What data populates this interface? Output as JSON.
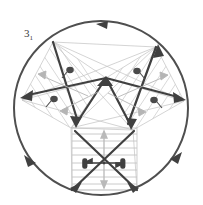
{
  "figure": {
    "title_label": "3",
    "title_subscript": "1",
    "type": "crystallographic-symmetry-diagram"
  },
  "colors": {
    "dark_stroke": "#4a4a4a",
    "mid_stroke": "#6e6e6e",
    "light_stroke": "#b8b8b8",
    "very_light_stroke": "#cccccc",
    "background": "#ffffff",
    "arrow_fill": "#4a4a4a"
  },
  "geometry": {
    "circle": {
      "cx": 101,
      "cy": 108,
      "r": 87
    },
    "circle_arrowheads": [
      {
        "name": "top-arrowhead",
        "angle_deg": 100
      },
      {
        "name": "lower-left-arrowhead",
        "angle_deg": 220
      },
      {
        "name": "lower-right-arrowhead",
        "angle_deg": 340
      }
    ],
    "pentagon_vertices": [
      {
        "name": "top-left-vertex",
        "x": 53,
        "y": 42
      },
      {
        "name": "top-right-vertex",
        "x": 156,
        "y": 47
      },
      {
        "name": "center-vertex",
        "x": 106,
        "y": 78
      },
      {
        "name": "left-vertex",
        "x": 22,
        "y": 100
      },
      {
        "name": "right-vertex",
        "x": 184,
        "y": 101
      },
      {
        "name": "inner-left-vertex",
        "x": 71,
        "y": 128
      },
      {
        "name": "inner-right-vertex",
        "x": 133,
        "y": 130
      },
      {
        "name": "bottom-left-vertex",
        "x": 72,
        "y": 190
      },
      {
        "name": "bottom-right-vertex",
        "x": 137,
        "y": 190
      }
    ],
    "bottom_square": {
      "x": 72,
      "y": 128,
      "w": 65,
      "h": 62,
      "stripes": 9
    },
    "hatch_panels": [
      {
        "name": "left-hatch-panel",
        "lines": 9
      },
      {
        "name": "right-hatch-panel",
        "lines": 9
      },
      {
        "name": "bottom-hatch-panel",
        "lines": 9
      }
    ],
    "small_arrows": [
      {
        "name": "small-arrow-upper-left",
        "x": 69,
        "y": 70
      },
      {
        "name": "small-arrow-upper-right",
        "x": 137,
        "y": 71
      },
      {
        "name": "small-arrow-mid-left",
        "x": 53,
        "y": 99
      },
      {
        "name": "small-arrow-mid-right",
        "x": 154,
        "y": 100
      },
      {
        "name": "small-arrow-center-left",
        "x": 86,
        "y": 164
      },
      {
        "name": "small-arrow-center-right",
        "x": 122,
        "y": 164
      }
    ],
    "center_point": {
      "x": 104,
      "y": 163
    }
  }
}
